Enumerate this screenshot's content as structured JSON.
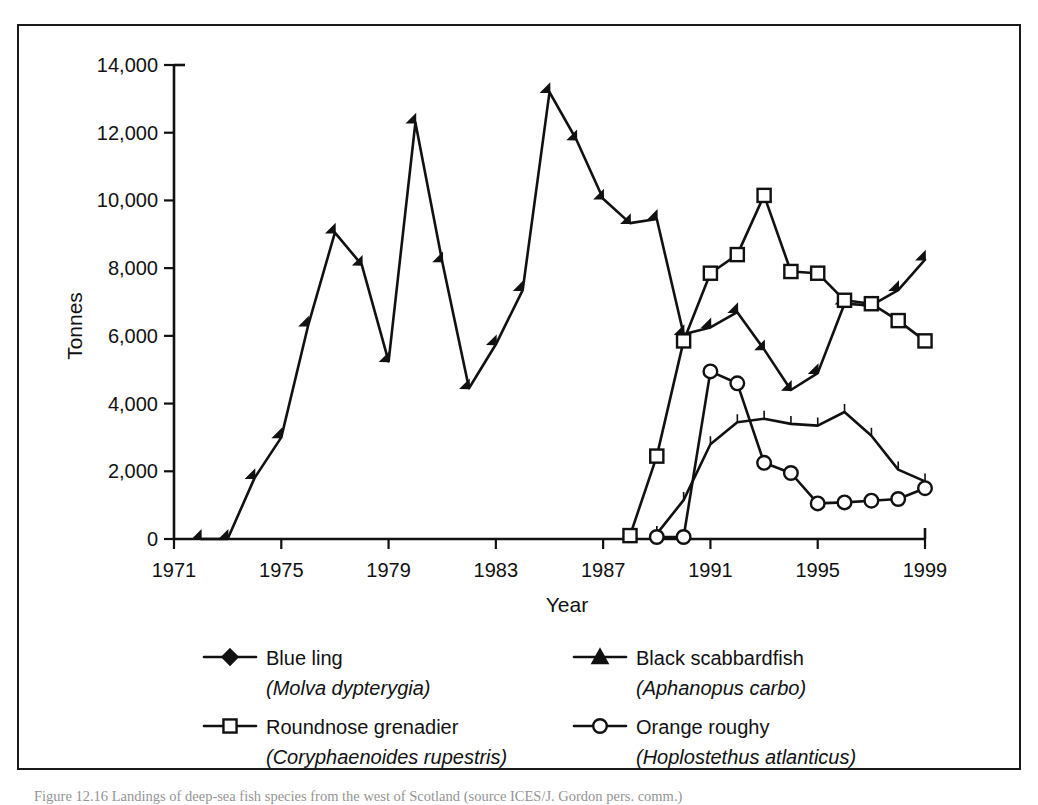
{
  "figure": {
    "caption": "Figure 12.16  Landings of deep-sea fish species from the west of Scotland (source ICES/J. Gordon pers. comm.)"
  },
  "axes": {
    "y_title": "Tonnes",
    "x_title": "Year",
    "y_ticks": [
      "0",
      "2,000",
      "4,000",
      "6,000",
      "8,000",
      "10,000",
      "12,000",
      "14,000"
    ],
    "x_ticks": [
      "1971",
      "1975",
      "1979",
      "1983",
      "1987",
      "1991",
      "1995",
      "1999"
    ]
  },
  "legend": {
    "entries": [
      {
        "common": "Blue ling",
        "scientific": "(Molva dypterygia)",
        "marker": "filled-diamond-icon"
      },
      {
        "common": "Black scabbardfish",
        "scientific": "(Aphanopus carbo)",
        "marker": "filled-triangle-icon"
      },
      {
        "common": "Roundnose grenadier",
        "scientific": "(Coryphaenoides rupestris)",
        "marker": "open-square-icon"
      },
      {
        "common": "Orange roughy",
        "scientific": "(Hoplostethus atlanticus)",
        "marker": "open-circle-icon"
      }
    ]
  },
  "chart_data": {
    "type": "line",
    "title": "",
    "xlabel": "Year",
    "ylabel": "Tonnes",
    "xlim": [
      1971,
      1999
    ],
    "ylim": [
      0,
      14000
    ],
    "ytick_step": 2000,
    "xtick_step": 4,
    "grid": false,
    "legend_position": "below-plot",
    "line_color": "#111111",
    "series": [
      {
        "name": "Blue ling",
        "scientific": "Molva dypterygia",
        "marker": "filled-diamond",
        "x": [
          1972,
          1973,
          1974,
          1975,
          1976,
          1977,
          1978,
          1979,
          1980,
          1981,
          1982,
          1983,
          1984,
          1985,
          1986,
          1987,
          1988,
          1989,
          1990,
          1991,
          1992,
          1993,
          1994,
          1995,
          1996,
          1997,
          1998,
          1999
        ],
        "values": [
          0,
          0,
          1800,
          3000,
          6300,
          9050,
          8100,
          5250,
          12300,
          8200,
          4450,
          5750,
          7350,
          13200,
          11800,
          10050,
          9330,
          9450,
          6050,
          6250,
          6700,
          5600,
          4400,
          4900,
          6950,
          6900,
          7350,
          8250
        ]
      },
      {
        "name": "Roundnose grenadier",
        "scientific": "Coryphaenoides rupestris",
        "marker": "open-square",
        "x": [
          1988,
          1989,
          1990,
          1991,
          1992,
          1993,
          1994,
          1995,
          1996,
          1997,
          1998,
          1999
        ],
        "values": [
          100,
          2450,
          5850,
          7850,
          8400,
          10150,
          7900,
          7850,
          7050,
          6950,
          6450,
          5850
        ]
      },
      {
        "name": "Black scabbardfish",
        "scientific": "Aphanopus carbo",
        "marker": "filled-triangle",
        "x": [
          1989,
          1990,
          1991,
          1992,
          1993,
          1994,
          1995,
          1996,
          1997,
          1998,
          1999
        ],
        "values": [
          150,
          1150,
          2800,
          3450,
          3550,
          3400,
          3350,
          3750,
          3050,
          2050,
          1700
        ]
      },
      {
        "name": "Orange roughy",
        "scientific": "Hoplostethus atlanticus",
        "marker": "open-circle",
        "x": [
          1989,
          1990,
          1991,
          1992,
          1993,
          1994,
          1995,
          1996,
          1997,
          1998,
          1999
        ],
        "values": [
          60,
          60,
          4950,
          4600,
          2250,
          1950,
          1050,
          1080,
          1130,
          1180,
          1500
        ]
      }
    ]
  }
}
